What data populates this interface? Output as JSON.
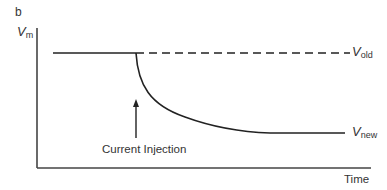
{
  "panel_label": "b",
  "y_axis": {
    "symbol": "V",
    "subscript": "m"
  },
  "x_axis": {
    "label": "Time"
  },
  "lines": {
    "old": {
      "symbol": "V",
      "subscript": "old",
      "style": "dashed"
    },
    "new": {
      "symbol": "V",
      "subscript": "new",
      "style": "solid"
    }
  },
  "annotation": {
    "label": "Current Injection",
    "arrow": "up"
  },
  "colors": {
    "line": "#222222",
    "axis": "#444444",
    "text": "#333333"
  }
}
